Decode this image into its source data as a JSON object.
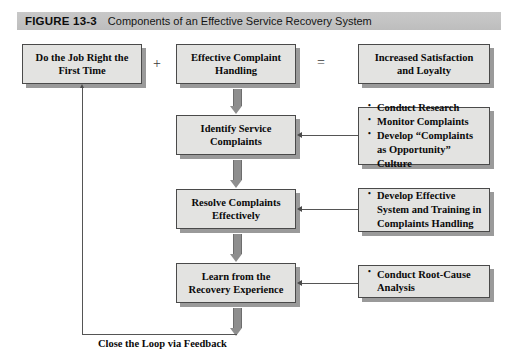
{
  "figure": {
    "label": "FIGURE 13-3",
    "caption": "Components of an Effective Service Recovery System"
  },
  "operators": {
    "plus": "+",
    "equals": "="
  },
  "nodes": {
    "do_job_right": {
      "line1": "Do the Job Right the",
      "line2": "First Time"
    },
    "effective_complaint_handling": {
      "line1": "Effective Complaint",
      "line2": "Handling"
    },
    "increased_satisfaction": {
      "line1": "Increased Satisfaction",
      "line2": "and Loyalty"
    },
    "identify_service_complaints": {
      "line1": "Identify Service",
      "line2": "Complaints"
    },
    "resolve_complaints": {
      "line1": "Resolve Complaints",
      "line2": "Effectively"
    },
    "learn_from_recovery": {
      "line1": "Learn from the",
      "line2": "Recovery Experience"
    }
  },
  "bullet_boxes": {
    "identify_actions": {
      "items": [
        {
          "text": "Conduct Research",
          "cont": []
        },
        {
          "text": "Monitor Complaints",
          "cont": []
        },
        {
          "text": "Develop “Complaints",
          "cont": [
            "as Opportunity”",
            "Culture"
          ]
        }
      ]
    },
    "resolve_actions": {
      "items": [
        {
          "text": "Develop Effective",
          "cont": [
            "System and Training in",
            "Complaints Handling"
          ]
        }
      ]
    },
    "learn_actions": {
      "items": [
        {
          "text": "Conduct Root-Cause",
          "cont": [
            "Analysis"
          ]
        }
      ]
    }
  },
  "loop": {
    "caption": "Close the Loop via Feedback"
  },
  "colors": {
    "banner": "#c4c4c4",
    "box_fill": "#e3e3e1",
    "box_border": "#4a4a4a",
    "box_shadow": "#9a9a9a",
    "arrow_gray": "#8e8e8e",
    "line_gray": "#555555",
    "text": "#0a0a0a"
  }
}
